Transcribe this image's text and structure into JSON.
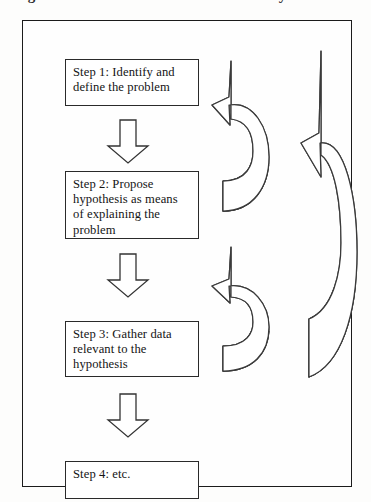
{
  "document": {
    "type": "flowchart-diagram",
    "title_sliver": "Figure: The scientific method research cycle",
    "background_color": "#fdfdfc",
    "frame_border_color": "#1b1b1b",
    "ink_color": "#141414",
    "arrow_fill": "#ffffff",
    "arrow_shade": "#e8e8e8"
  },
  "steps": [
    {
      "id": "step-1",
      "lines": [
        "Step 1: Identify and",
        "define the problem"
      ]
    },
    {
      "id": "step-2",
      "lines": [
        "Step 2: Propose",
        "hypothesis as means",
        "of explaining the",
        "problem"
      ]
    },
    {
      "id": "step-3",
      "lines": [
        "Step 3: Gather data",
        "relevant to the",
        "hypothesis"
      ]
    },
    {
      "id": "step-4",
      "lines": [
        "Step 4: etc."
      ]
    }
  ],
  "connectors": [
    {
      "id": "arrow-1-2",
      "icon": "down-arrow-icon",
      "from": "step-1",
      "to": "step-2"
    },
    {
      "id": "arrow-2-3",
      "icon": "down-arrow-icon",
      "from": "step-2",
      "to": "step-3"
    },
    {
      "id": "arrow-3-4",
      "icon": "down-arrow-icon",
      "from": "step-3",
      "to": "step-4"
    }
  ],
  "feedback_loops": [
    {
      "id": "loop-short-upper",
      "icon": "curved-feedback-arrow-icon",
      "from": "step-2",
      "to": "step-1"
    },
    {
      "id": "loop-short-lower",
      "icon": "curved-feedback-arrow-icon",
      "from": "step-3",
      "to": "step-2"
    },
    {
      "id": "loop-long",
      "icon": "curved-feedback-arrow-icon",
      "from": "step-3",
      "to": "step-1"
    }
  ]
}
